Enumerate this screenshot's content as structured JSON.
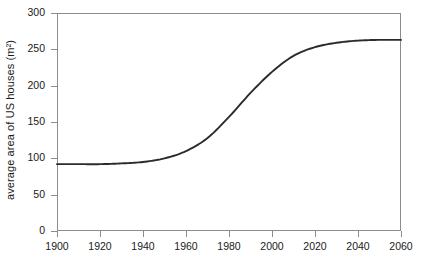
{
  "chart_data": {
    "type": "line",
    "title": "",
    "subtitle": "",
    "xlabel": "",
    "ylabel": "average area of US houses (m²)",
    "xlim": [
      1900,
      2060
    ],
    "ylim": [
      0,
      300
    ],
    "xticks": [
      1900,
      1920,
      1940,
      1960,
      1980,
      2000,
      2020,
      2040,
      2060
    ],
    "xtick_labels": [
      "1900",
      "1920",
      "1940",
      "1960",
      "1980",
      "2000",
      "2020",
      "2040",
      "2060"
    ],
    "yticks": [
      0,
      50,
      100,
      150,
      200,
      250,
      300
    ],
    "ytick_labels": [
      "0",
      "50",
      "100",
      "150",
      "200",
      "250",
      "300"
    ],
    "grid": false,
    "legend": null,
    "annotations": [],
    "line_color": "#2b2b2b",
    "axis_color": "#8c8c8c",
    "background": "#ffffff",
    "series": [
      {
        "name": "average area of US houses",
        "x": [
          1900,
          1910,
          1920,
          1930,
          1940,
          1950,
          1960,
          1970,
          1980,
          1990,
          2000,
          2010,
          2020,
          2030,
          2040,
          2050,
          2060
        ],
        "values": [
          92,
          92,
          92,
          93,
          95,
          100,
          110,
          128,
          157,
          190,
          219,
          241,
          253,
          259,
          262,
          263,
          263
        ]
      }
    ]
  }
}
